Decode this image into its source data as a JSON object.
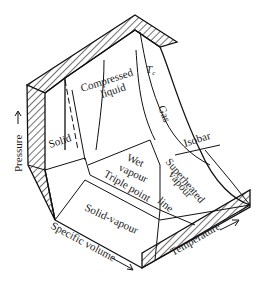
{
  "figure": {
    "type": "PVT surface (pressure-specific volume-temperature) of a substance that contracts on freezing",
    "axes": {
      "vertical": "Pressure",
      "left_horizontal": "Specific volume",
      "right_horizontal": "Temperature"
    },
    "regions": {
      "solid": "Solid",
      "liquid": "Compressed liquid",
      "gas": "Gas",
      "wet": "Wet vapour",
      "superheated": "Superheated vapour",
      "solid_vapour": "Solid-vapour"
    },
    "annotations": {
      "critical_isotherm": "T",
      "critical_isotherm_sub": "c",
      "isobar": "Isobar",
      "triple_line_1": "Triple point",
      "triple_line_2": "line"
    },
    "labels_split": {
      "liquid_1": "Compressed",
      "liquid_2": "liquid",
      "wet_1": "Wet",
      "wet_2": "vapour",
      "sh_1": "Superheated",
      "sh_2": "vapour"
    },
    "colors": {
      "ink": "#111111",
      "paper": "#ffffff"
    }
  }
}
